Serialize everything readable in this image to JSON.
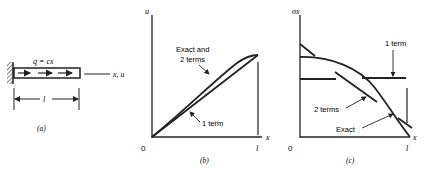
{
  "panel_a": {
    "load_label": "q = cx",
    "axis_label": "x, u",
    "length_label": "l",
    "caption": "(a)"
  },
  "panel_b": {
    "y_axis_label": "u",
    "x_axis_label": "x",
    "origin_label": "0",
    "end_label": "l",
    "annotation_exact_line1": "Exact and",
    "annotation_exact_line2": "2 terms",
    "annotation_one_term": "1 term",
    "caption": "(b)"
  },
  "panel_c": {
    "y_axis_label": "σx",
    "x_axis_label": "x",
    "origin_label": "0",
    "end_label": "l",
    "annotation_one_term": "1 term",
    "annotation_two_terms": "2 terms",
    "annotation_exact": "Exact",
    "caption": "(c)"
  }
}
